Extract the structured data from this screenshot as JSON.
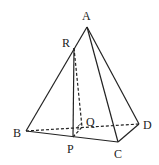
{
  "diagram": {
    "type": "pyramid",
    "points": {
      "A": {
        "label": "A",
        "x": 87,
        "y": 27,
        "lx": 82,
        "ly": 20
      },
      "R": {
        "label": "R",
        "x": 74,
        "y": 48,
        "lx": 62,
        "ly": 47
      },
      "B": {
        "label": "B",
        "x": 26,
        "y": 131,
        "lx": 13,
        "ly": 137
      },
      "P": {
        "label": "P",
        "x": 73,
        "y": 137,
        "lx": 67,
        "ly": 153
      },
      "Q": {
        "label": "Q",
        "x": 82,
        "y": 127,
        "lx": 86,
        "ly": 126
      },
      "D": {
        "label": "D",
        "x": 139,
        "y": 124,
        "lx": 143,
        "ly": 129
      },
      "C": {
        "label": "C",
        "x": 118,
        "y": 142,
        "lx": 114,
        "ly": 158
      }
    },
    "solid_edges": [
      [
        "A",
        "B"
      ],
      [
        "A",
        "C"
      ],
      [
        "A",
        "D"
      ],
      [
        "B",
        "C"
      ],
      [
        "C",
        "D"
      ],
      [
        "R",
        "P"
      ]
    ],
    "dashed_edges": [
      [
        "B",
        "D"
      ],
      [
        "R",
        "Q"
      ],
      [
        "P",
        "Q"
      ]
    ],
    "colors": {
      "stroke": "#222222",
      "background": "#ffffff"
    }
  }
}
